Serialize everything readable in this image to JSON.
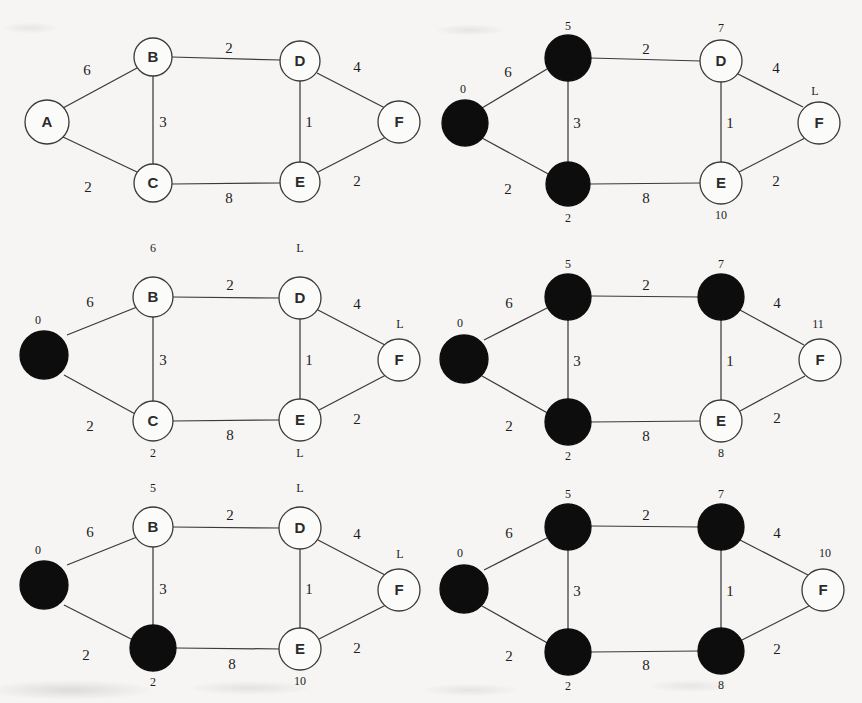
{
  "figure": {
    "background_color": "#f6f5f3",
    "ink_color": "#1d1d1d",
    "visited_node_color": "#0d0d0d",
    "unvisited_node_color": "#fbfbf9",
    "panel_count": 6
  },
  "graph": {
    "nodes": [
      "A",
      "B",
      "C",
      "D",
      "E",
      "F"
    ],
    "edges": [
      {
        "from": "A",
        "to": "B",
        "weight": "6"
      },
      {
        "from": "A",
        "to": "C",
        "weight": "2"
      },
      {
        "from": "B",
        "to": "C",
        "weight": "3"
      },
      {
        "from": "B",
        "to": "D",
        "weight": "2"
      },
      {
        "from": "C",
        "to": "E",
        "weight": "8"
      },
      {
        "from": "D",
        "to": "E",
        "weight": "1"
      },
      {
        "from": "D",
        "to": "F",
        "weight": "4"
      },
      {
        "from": "E",
        "to": "F",
        "weight": "2"
      }
    ]
  },
  "panels": [
    {
      "id": "panel-1",
      "step": "1",
      "caption": "",
      "nodes": [
        {
          "id": "A",
          "label": "A",
          "visited": false,
          "dist": ""
        },
        {
          "id": "B",
          "label": "B",
          "visited": false,
          "dist": ""
        },
        {
          "id": "C",
          "label": "C",
          "visited": false,
          "dist": ""
        },
        {
          "id": "D",
          "label": "D",
          "visited": false,
          "dist": ""
        },
        {
          "id": "E",
          "label": "E",
          "visited": false,
          "dist": ""
        },
        {
          "id": "F",
          "label": "F",
          "visited": false,
          "dist": ""
        }
      ],
      "weights": {
        "AB": "6",
        "AC": "2",
        "BC": "3",
        "BD": "2",
        "CE": "8",
        "DE": "1",
        "DF": "4",
        "EF": "2"
      }
    },
    {
      "id": "panel-2",
      "step": "2",
      "caption": "",
      "nodes": [
        {
          "id": "A",
          "label": "",
          "visited": true,
          "dist": "0"
        },
        {
          "id": "B",
          "label": "",
          "visited": true,
          "dist": "5"
        },
        {
          "id": "C",
          "label": "",
          "visited": true,
          "dist": "2"
        },
        {
          "id": "D",
          "label": "D",
          "visited": false,
          "dist": "7"
        },
        {
          "id": "E",
          "label": "E",
          "visited": false,
          "dist": "10"
        },
        {
          "id": "F",
          "label": "F",
          "visited": false,
          "dist": "L"
        }
      ],
      "weights": {
        "AB": "6",
        "AC": "2",
        "BC": "3",
        "BD": "2",
        "CE": "8",
        "DE": "1",
        "DF": "4",
        "EF": "2"
      }
    },
    {
      "id": "panel-3",
      "step": "3",
      "caption": "",
      "nodes": [
        {
          "id": "A",
          "label": "",
          "visited": true,
          "dist": "0"
        },
        {
          "id": "B",
          "label": "B",
          "visited": false,
          "dist": "6"
        },
        {
          "id": "C",
          "label": "C",
          "visited": false,
          "dist": "2"
        },
        {
          "id": "D",
          "label": "D",
          "visited": false,
          "dist": "L"
        },
        {
          "id": "E",
          "label": "E",
          "visited": false,
          "dist": "L"
        },
        {
          "id": "F",
          "label": "F",
          "visited": false,
          "dist": "L"
        }
      ],
      "weights": {
        "AB": "6",
        "AC": "2",
        "BC": "3",
        "BD": "2",
        "CE": "8",
        "DE": "1",
        "DF": "4",
        "EF": "2"
      }
    },
    {
      "id": "panel-4",
      "step": "4",
      "caption": "",
      "nodes": [
        {
          "id": "A",
          "label": "",
          "visited": true,
          "dist": "0"
        },
        {
          "id": "B",
          "label": "",
          "visited": true,
          "dist": "5"
        },
        {
          "id": "C",
          "label": "",
          "visited": true,
          "dist": "2"
        },
        {
          "id": "D",
          "label": "",
          "visited": true,
          "dist": "7"
        },
        {
          "id": "E",
          "label": "E",
          "visited": false,
          "dist": "8"
        },
        {
          "id": "F",
          "label": "F",
          "visited": false,
          "dist": "11"
        }
      ],
      "weights": {
        "AB": "6",
        "AC": "2",
        "BC": "3",
        "BD": "2",
        "CE": "8",
        "DE": "1",
        "DF": "4",
        "EF": "2"
      }
    },
    {
      "id": "panel-5",
      "step": "5",
      "caption": "",
      "nodes": [
        {
          "id": "A",
          "label": "",
          "visited": true,
          "dist": "0"
        },
        {
          "id": "B",
          "label": "B",
          "visited": false,
          "dist": "5"
        },
        {
          "id": "C",
          "label": "",
          "visited": true,
          "dist": "2"
        },
        {
          "id": "D",
          "label": "D",
          "visited": false,
          "dist": "L"
        },
        {
          "id": "E",
          "label": "E",
          "visited": false,
          "dist": "10"
        },
        {
          "id": "F",
          "label": "F",
          "visited": false,
          "dist": "L"
        }
      ],
      "weights": {
        "AB": "6",
        "AC": "2",
        "BC": "3",
        "BD": "2",
        "CE": "8",
        "DE": "1",
        "DF": "4",
        "EF": "2"
      }
    },
    {
      "id": "panel-6",
      "step": "6",
      "caption": "",
      "nodes": [
        {
          "id": "A",
          "label": "",
          "visited": true,
          "dist": "0"
        },
        {
          "id": "B",
          "label": "",
          "visited": true,
          "dist": "5"
        },
        {
          "id": "C",
          "label": "",
          "visited": true,
          "dist": "2"
        },
        {
          "id": "D",
          "label": "",
          "visited": true,
          "dist": "7"
        },
        {
          "id": "E",
          "label": "",
          "visited": true,
          "dist": "8"
        },
        {
          "id": "F",
          "label": "F",
          "visited": false,
          "dist": "10"
        }
      ],
      "weights": {
        "AB": "6",
        "AC": "2",
        "BC": "3",
        "BD": "2",
        "CE": "8",
        "DE": "1",
        "DF": "4",
        "EF": "2"
      }
    }
  ]
}
